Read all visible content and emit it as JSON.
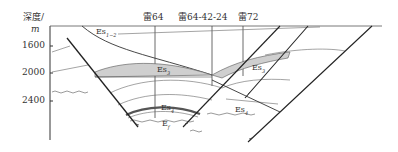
{
  "axis": {
    "title": "深度/",
    "unit": "m",
    "ticks": [
      "1600",
      "2000",
      "2400"
    ]
  },
  "wells": [
    {
      "name": "雷64"
    },
    {
      "name": "雷64-42-24"
    },
    {
      "name": "雷72"
    }
  ],
  "formations": {
    "es12": {
      "base": "Es",
      "sub": "1−2"
    },
    "es3": {
      "base": "Es",
      "sub": "3"
    },
    "es3_right": {
      "base": "Es",
      "sub": "3"
    },
    "es4_center": {
      "base": "Es",
      "sub": "4"
    },
    "es4_right": {
      "base": "Es",
      "sub": "4"
    },
    "ef": {
      "base": "E",
      "sub": "f"
    }
  },
  "colors": {
    "line": "#333333",
    "shade": "#cfcfcf",
    "thin": "#555555"
  }
}
